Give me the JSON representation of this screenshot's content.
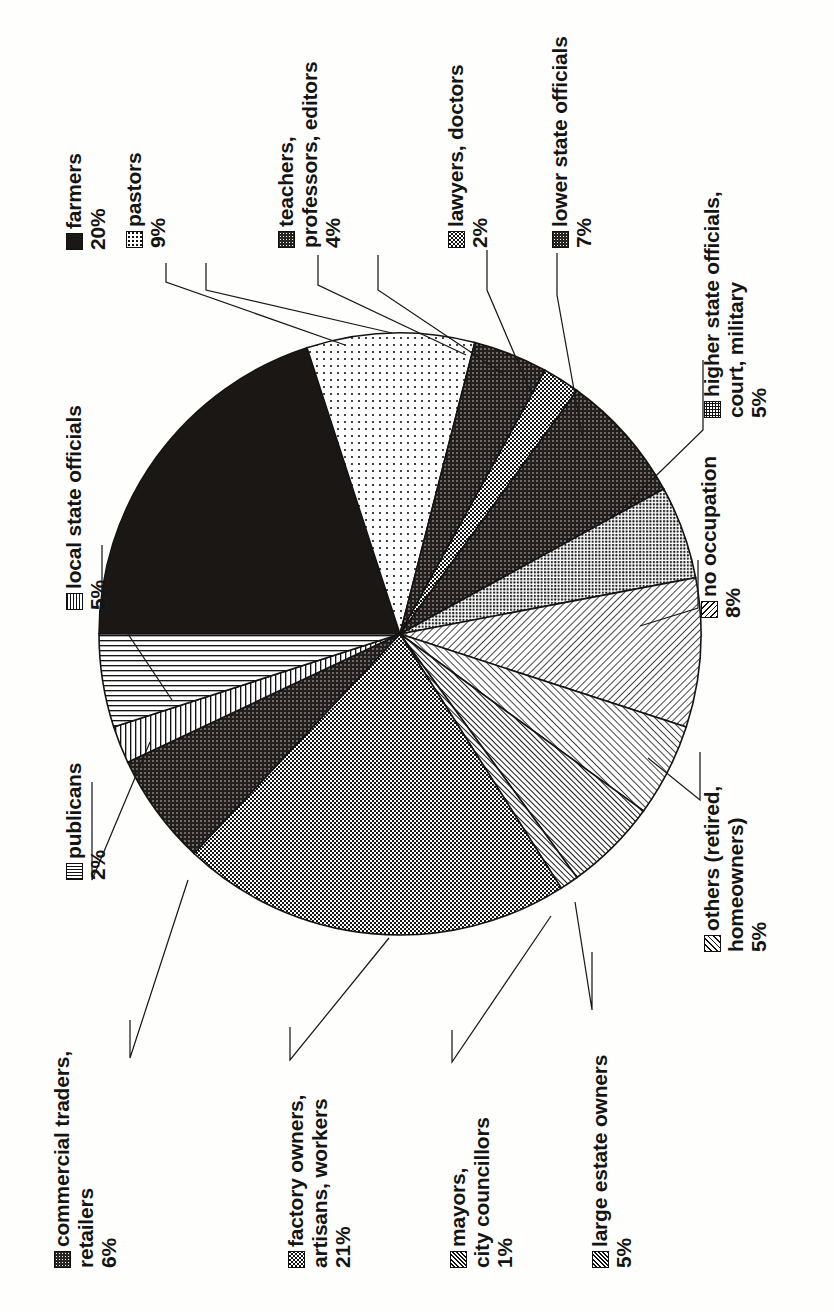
{
  "chart_data": {
    "type": "pie",
    "title": "",
    "orientation": "rotated-90-ccw",
    "units": "percent",
    "total": 100,
    "legend_position": "callout-labels",
    "categories": [
      "farmers",
      "pastors",
      "teachers, professors, editors",
      "lawyers, doctors",
      "lower state officials",
      "higher state officials, court, military",
      "no occupation",
      "others (retired, homeowners)",
      "large estate owners",
      "mayors, city councillors",
      "factory owners, artisans, workers",
      "commercial traders, retailers",
      "publicans",
      "local state officials"
    ],
    "values": [
      20,
      9,
      4,
      2,
      7,
      5,
      8,
      5,
      5,
      1,
      21,
      6,
      2,
      5
    ],
    "slices": [
      {
        "label_line1": "farmers",
        "label_line2": "",
        "label_line3": "",
        "value": 20,
        "value_text": "20%",
        "pattern": "p-solid"
      },
      {
        "label_line1": "pastors",
        "label_line2": "",
        "label_line3": "",
        "value": 9,
        "value_text": "9%",
        "pattern": "p-dots-lite"
      },
      {
        "label_line1": "teachers,",
        "label_line2": "professors, editors",
        "label_line3": "",
        "value": 4,
        "value_text": "4%",
        "pattern": "p-dense"
      },
      {
        "label_line1": "lawyers, doctors",
        "label_line2": "",
        "label_line3": "",
        "value": 2,
        "value_text": "2%",
        "pattern": "p-check"
      },
      {
        "label_line1": "lower state officials",
        "label_line2": "",
        "label_line3": "",
        "value": 7,
        "value_text": "7%",
        "pattern": "p-dense"
      },
      {
        "label_line1": "higher state officials,",
        "label_line2": "court, military",
        "label_line3": "",
        "value": 5,
        "value_text": "5%",
        "pattern": "p-fine"
      },
      {
        "label_line1": "no occupation",
        "label_line2": "",
        "label_line3": "",
        "value": 8,
        "value_text": "8%",
        "pattern": "p-diag"
      },
      {
        "label_line1": "others (retired,",
        "label_line2": "homeowners)",
        "label_line3": "",
        "value": 5,
        "value_text": "5%",
        "pattern": "p-diag-r"
      },
      {
        "label_line1": "large estate owners",
        "label_line2": "",
        "label_line3": "",
        "value": 5,
        "value_text": "5%",
        "pattern": "p-diag-d"
      },
      {
        "label_line1": "mayors,",
        "label_line2": "city councillors",
        "label_line3": "",
        "value": 1,
        "value_text": "1%",
        "pattern": "p-diag-d"
      },
      {
        "label_line1": "factory owners,",
        "label_line2": "artisans, workers",
        "label_line3": "",
        "value": 21,
        "value_text": "21%",
        "pattern": "p-check"
      },
      {
        "label_line1": "commercial traders,",
        "label_line2": "retailers",
        "label_line3": "",
        "value": 6,
        "value_text": "6%",
        "pattern": "p-dense"
      },
      {
        "label_line1": "publicans",
        "label_line2": "",
        "label_line3": "",
        "value": 2,
        "value_text": "2%",
        "pattern": "p-vlines"
      },
      {
        "label_line1": "local state officials",
        "label_line2": "",
        "label_line3": "",
        "value": 5,
        "value_text": "5%",
        "pattern": "p-hlines"
      }
    ],
    "colors": {
      "ink": "#141414",
      "paper": "#fefefc",
      "solid_fill": "#1b1714"
    }
  }
}
